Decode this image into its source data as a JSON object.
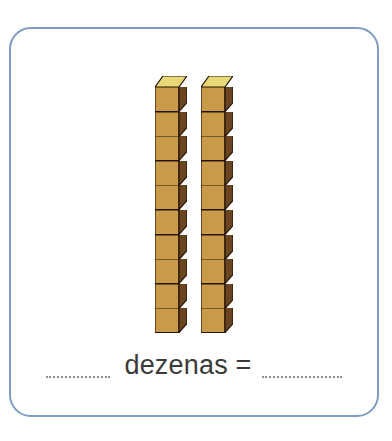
{
  "card": {
    "border_color": "#7d9cc4",
    "background": "#ffffff"
  },
  "illustration": {
    "name": "base-ten-rods",
    "description": "Two base-ten rods of ten unit cubes each",
    "rod_count": 2,
    "cubes_per_rod": 10,
    "total_cubes": 20,
    "cube_colors": {
      "front": "#c89a4a",
      "top": "#e8d878",
      "side": "#6b4520",
      "outline": "#241406"
    }
  },
  "answer": {
    "blank_left": "",
    "blank_right": "",
    "label": "dezenas =",
    "text_color": "#3a3a3a",
    "blank_color": "#8e8e8e"
  },
  "chart_data": {
    "type": "bar",
    "title": "dezenas =",
    "categories": [
      "dezena 1",
      "dezena 2"
    ],
    "values": [
      10,
      10
    ],
    "xlabel": "",
    "ylabel": "unidades",
    "ylim": [
      0,
      10
    ],
    "total": 20
  }
}
